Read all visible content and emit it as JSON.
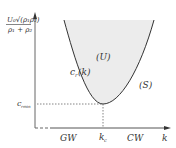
{
  "diagram": {
    "y_axis_label": {
      "num": "U₀√(ρ₁ρ₂)",
      "den": "ρ₁ + ρ₂"
    },
    "x_axis_label": "k",
    "curve_label": "c",
    "curve_label_sub": "r",
    "curve_label_arg": "(k)",
    "unstable_region": "(U)",
    "stable_region": "(S)",
    "min_label": "c",
    "min_label_sub": "rmin",
    "critical_k": "k",
    "critical_k_sub": "c",
    "gw_label": "GW",
    "cw_label": "CW",
    "colors": {
      "curve": "#333333",
      "fill": "#eeeeee",
      "axis": "#444444"
    }
  }
}
